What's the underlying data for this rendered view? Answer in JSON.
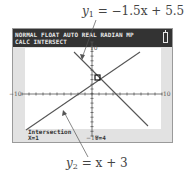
{
  "captions": {
    "top": {
      "lhs": "y",
      "sub": "1",
      "rhs": " = −1.5x + 5.5"
    },
    "bottom": {
      "lhs": "y",
      "sub": "2",
      "rhs": " = x + 3"
    }
  },
  "calculator": {
    "status_line1": "NORMAL FLOAT AUTO REAL RADIAN MP",
    "status_line2": "CALC INTERSECT",
    "battery_icon": "battery-icon",
    "window": {
      "xmin": -10,
      "xmax": 10,
      "ymin": -10,
      "ymax": 10,
      "xscl": 1,
      "yscl": 1
    },
    "axis_labels": {
      "xmin": "−10",
      "xmax": "10",
      "ymax": "10",
      "ymin": "−10"
    },
    "result": {
      "label": "Intersection",
      "x": "X=1",
      "y": "Y=4"
    }
  },
  "colors": {
    "status_bar": "#333333",
    "status_text": "#e8e8e8",
    "screen_margin": "#e2e2e2",
    "graph_bg": "#ffffff",
    "line": "#555555"
  }
}
